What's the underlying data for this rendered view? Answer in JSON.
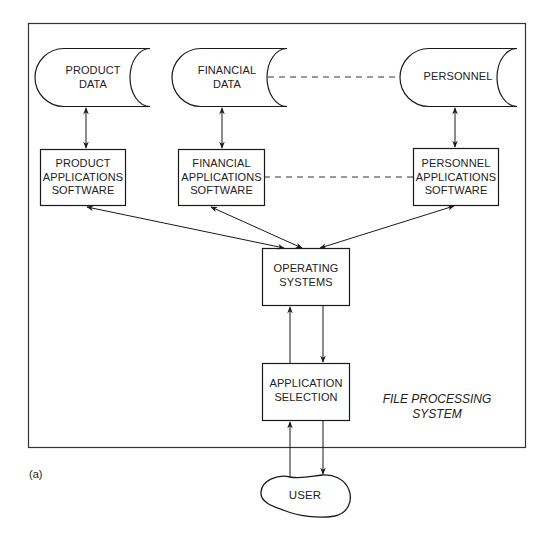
{
  "diagram": {
    "caption": {
      "line1": "FILE PROCESSING",
      "line2": "SYSTEM"
    },
    "figure_label": "(a)",
    "data_stores": [
      {
        "id": "product-data",
        "line1": "PRODUCT",
        "line2": "DATA"
      },
      {
        "id": "financial-data",
        "line1": "FINANCIAL",
        "line2": "DATA"
      },
      {
        "id": "personnel",
        "line1": "PERSONNEL",
        "line2": ""
      }
    ],
    "software_boxes": [
      {
        "id": "product-applications-software",
        "line1": "PRODUCT",
        "line2": "APPLICATIONS",
        "line3": "SOFTWARE"
      },
      {
        "id": "financial-applications-software",
        "line1": "FINANCIAL",
        "line2": "APPLICATIONS",
        "line3": "SOFTWARE"
      },
      {
        "id": "personnel-applications-software",
        "line1": "PERSONNEL",
        "line2": "APPLICATIONS",
        "line3": "SOFTWARE"
      }
    ],
    "operating_systems": {
      "line1": "OPERATING",
      "line2": "SYSTEMS"
    },
    "application_selection": {
      "line1": "APPLICATION",
      "line2": "SELECTION"
    },
    "user": {
      "label": "USER"
    },
    "connections": [
      {
        "from": "product-data",
        "to": "product-applications-software",
        "style": "solid",
        "arrows": "both"
      },
      {
        "from": "financial-data",
        "to": "financial-applications-software",
        "style": "solid",
        "arrows": "both"
      },
      {
        "from": "personnel",
        "to": "personnel-applications-software",
        "style": "solid",
        "arrows": "both"
      },
      {
        "from": "financial-data",
        "to": "personnel",
        "style": "dashed",
        "arrows": "none"
      },
      {
        "from": "financial-applications-software",
        "to": "personnel-applications-software",
        "style": "dashed",
        "arrows": "none"
      },
      {
        "from": "product-applications-software",
        "to": "operating-systems",
        "style": "solid",
        "arrows": "both"
      },
      {
        "from": "financial-applications-software",
        "to": "operating-systems",
        "style": "solid",
        "arrows": "both"
      },
      {
        "from": "personnel-applications-software",
        "to": "operating-systems",
        "style": "solid",
        "arrows": "both"
      },
      {
        "from": "application-selection",
        "to": "operating-systems",
        "style": "solid",
        "arrows": "end"
      },
      {
        "from": "operating-systems",
        "to": "application-selection",
        "style": "solid",
        "arrows": "end"
      },
      {
        "from": "user",
        "to": "application-selection",
        "style": "solid",
        "arrows": "end"
      },
      {
        "from": "application-selection",
        "to": "user",
        "style": "solid",
        "arrows": "end"
      }
    ]
  }
}
